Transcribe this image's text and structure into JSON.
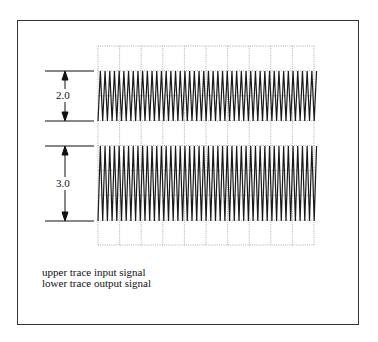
{
  "figure": {
    "upper_label": "2.0",
    "lower_label": "3.0",
    "caption": {
      "line1": "upper trace input signal",
      "line2": "lower trace output signal"
    }
  },
  "colors": {
    "trace": "#1a1a1a",
    "grid": "#8a8a8a",
    "frame": "#333333"
  }
}
